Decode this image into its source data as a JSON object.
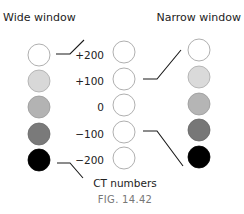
{
  "figure": {
    "label": "FIG. 14.42",
    "center_label": "CT numbers"
  },
  "wide_window": {
    "title": "Wide window",
    "shades": [
      "#ffffff",
      "#d8d8d8",
      "#b3b3b3",
      "#7a7a7a",
      "#000000"
    ]
  },
  "narrow_window": {
    "title": "Narrow window",
    "shades": [
      "#ffffff",
      "#dadada",
      "#b5b5b5",
      "#777777",
      "#000000"
    ]
  },
  "ct_numbers": {
    "values": [
      "+200",
      "+100",
      "0",
      "−100",
      "−200"
    ]
  },
  "colors": {
    "stroke": "#9a9a9a",
    "line": "#1a1a1a"
  }
}
